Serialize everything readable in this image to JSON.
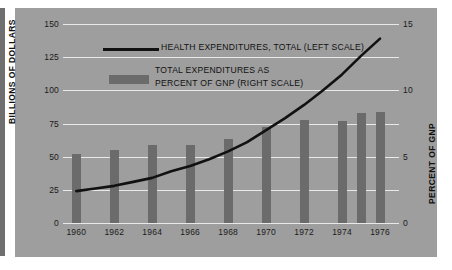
{
  "chart_data": {
    "type": "bar",
    "title": "",
    "xlabel": "",
    "ylabel": "BILLIONS OF DOLLARS",
    "y2label": "PERCENT OF GNP",
    "ylim": [
      0,
      150
    ],
    "y2lim": [
      0,
      15
    ],
    "grid": true,
    "legend_position": "upper-left",
    "left_ticks": [
      "150",
      "125",
      "100",
      "75",
      "50",
      "25",
      "0"
    ],
    "left_tick_values": [
      150,
      125,
      100,
      75,
      50,
      25,
      0
    ],
    "right_ticks": [
      "15",
      "10",
      "5",
      "0"
    ],
    "right_tick_values": [
      15,
      10,
      5,
      0
    ],
    "categories": [
      "1960",
      "1962",
      "1964",
      "1966",
      "1968",
      "1970",
      "1972",
      "1974",
      "1976"
    ],
    "series": [
      {
        "name": "TOTAL EXPENDITURES AS PERCENT OF GNP (RIGHT SCALE)",
        "type": "bar",
        "axis": "right",
        "color": "#6b6b6b",
        "x": [
          1960,
          1962,
          1964,
          1966,
          1968,
          1970,
          1972,
          1974,
          1975,
          1976
        ],
        "values": [
          5.2,
          5.5,
          5.9,
          5.9,
          6.3,
          7.2,
          7.8,
          7.7,
          8.3,
          8.4
        ]
      },
      {
        "name": "HEALTH EXPENDITURES, TOTAL (LEFT SCALE)",
        "type": "line",
        "axis": "left",
        "color": "#111111",
        "x": [
          1960,
          1961,
          1962,
          1963,
          1964,
          1965,
          1966,
          1967,
          1968,
          1969,
          1970,
          1971,
          1972,
          1973,
          1974,
          1975,
          1976
        ],
        "values": [
          24,
          26,
          28,
          31,
          34,
          39,
          43,
          48,
          54,
          61,
          70,
          79,
          89,
          100,
          112,
          126,
          139
        ]
      }
    ]
  },
  "legend": {
    "line_label": "HEALTH EXPENDITURES, TOTAL (LEFT SCALE)",
    "bar_label_line1": "TOTAL EXPENDITURES AS",
    "bar_label_line2": "PERCENT OF GNP (RIGHT SCALE)"
  },
  "colors": {
    "panel_background": "#9e9e9e",
    "bar": "#6b6b6b",
    "line": "#111111",
    "gridline": "#e9e9e9",
    "text": "#1b1b1b",
    "gutter": "#6f6f6f"
  }
}
